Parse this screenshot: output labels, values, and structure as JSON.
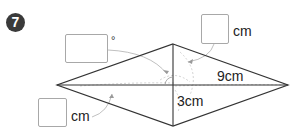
{
  "problem": {
    "number": "7",
    "shape": "rhombus",
    "diagonal_long_label": "9cm",
    "half_diagonal_short_label": "3cm",
    "answers": [
      {
        "id": "angle",
        "unit": "°",
        "value": ""
      },
      {
        "id": "top-right-length",
        "unit": "cm",
        "value": ""
      },
      {
        "id": "left-length",
        "unit": "cm",
        "value": ""
      }
    ]
  },
  "colors": {
    "line": "#333333",
    "dashed": "#bdbdbd",
    "box_border": "#a8a8a8",
    "badge_bg": "#3a3a3a"
  }
}
